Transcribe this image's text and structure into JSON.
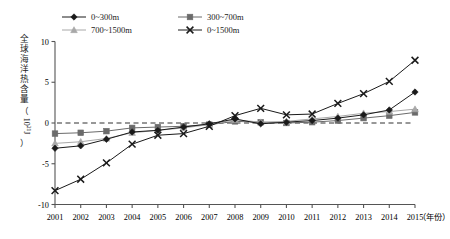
{
  "chart_data": {
    "type": "line",
    "title": "",
    "xlabel": "年份",
    "ylabel": "全球海洋热含量",
    "yunit": "10²¹J",
    "ylabel_full": "全球海洋热含量（10²¹J）",
    "categories": [
      "2001",
      "2002",
      "2003",
      "2004",
      "2005",
      "2006",
      "2007",
      "2008",
      "2009",
      "2010",
      "2011",
      "2012",
      "2013",
      "2014",
      "2015"
    ],
    "x": [
      2001,
      2002,
      2003,
      2004,
      2005,
      2006,
      2007,
      2008,
      2009,
      2010,
      2011,
      2012,
      2013,
      2014,
      2015
    ],
    "ylim": [
      -10,
      10
    ],
    "yticks": [
      10,
      5,
      0,
      -5,
      -10
    ],
    "ytick_labels": [
      "10",
      "5",
      "0",
      "-5",
      "-10"
    ],
    "xlim": [
      2001,
      2015
    ],
    "grid": false,
    "zero_reference_line": 0,
    "legend_position": "top",
    "series": [
      {
        "name": "0~300m",
        "marker": "diamond",
        "color": "#1a1a1a",
        "values": [
          -3.1,
          -2.8,
          -2.0,
          -1.1,
          -0.9,
          -0.5,
          -0.1,
          0.5,
          -0.1,
          0.1,
          0.3,
          0.6,
          1.0,
          1.6,
          3.8
        ]
      },
      {
        "name": "300~700m",
        "marker": "square",
        "color": "#6b6b6b",
        "values": [
          -1.3,
          -1.2,
          -1.0,
          -0.6,
          -0.5,
          -0.4,
          -0.2,
          0.2,
          0.1,
          0.0,
          0.1,
          0.3,
          0.6,
          0.9,
          1.3
        ]
      },
      {
        "name": "700~1500m",
        "marker": "triangle",
        "color": "#a8a8a8",
        "values": [
          -2.5,
          -2.3,
          -1.9,
          -1.2,
          -0.9,
          -0.6,
          -0.2,
          0.4,
          0.1,
          0.2,
          0.5,
          0.8,
          1.2,
          1.4,
          1.7
        ]
      },
      {
        "name": "0~1500m",
        "marker": "x",
        "color": "#1a1a1a",
        "values": [
          -8.3,
          -6.9,
          -4.9,
          -2.6,
          -1.5,
          -1.3,
          -0.4,
          0.9,
          1.8,
          1.0,
          1.1,
          2.4,
          3.6,
          5.1,
          7.7
        ]
      }
    ]
  },
  "legend": {
    "items": [
      {
        "label": "0~300m"
      },
      {
        "label": "300~700m"
      },
      {
        "label": "700~1500m"
      },
      {
        "label": "0~1500m"
      }
    ]
  },
  "axes": {
    "x_axis_unit_label": "（年份）",
    "y_axis_label_chars": "全球海洋热含量",
    "y_axis_unit": "（10²¹J）"
  }
}
